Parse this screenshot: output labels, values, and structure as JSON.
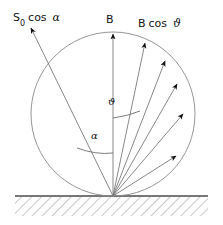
{
  "figure": {
    "labels": {
      "incident_flux": {
        "symbol": "S",
        "subscript": "0",
        "expression": "cos",
        "angle": "α",
        "full": "S0 cos α"
      },
      "vertical_vector": {
        "text": "B"
      },
      "cosine_vector": {
        "symbol": "B",
        "expression": "cos",
        "angle": "ϑ",
        "full": "B cos ϑ"
      },
      "angle_theta": {
        "text": "ϑ"
      },
      "angle_alpha": {
        "text": "α"
      }
    },
    "colors": {
      "stroke": "#8a8a8a",
      "stroke_dark": "#6e6e6e",
      "text": "#141414",
      "ground_line": "#4a4a4a",
      "hatch": "#9a9a9a",
      "background": "#ffffff"
    },
    "geometry": {
      "origin": {
        "x": 113,
        "y": 196
      },
      "circle": {
        "cx": 113,
        "cy": 114,
        "r": 82
      },
      "ground": {
        "x1": 15,
        "x2": 208,
        "y": 196,
        "band_height": 20
      },
      "incident_ray": {
        "tip_x": 30,
        "tip_y": 27
      },
      "vertical_ray": {
        "tip_x": 113,
        "tip_y": 33
      },
      "emitted_rays": [
        {
          "name": "ray-1",
          "tip_x": 146,
          "tip_y": 42
        },
        {
          "name": "ray-2",
          "tip_x": 166,
          "tip_y": 60
        },
        {
          "name": "ray-3",
          "tip_x": 178,
          "tip_y": 83
        },
        {
          "name": "ray-4",
          "tip_x": 184,
          "tip_y": 113
        },
        {
          "name": "ray-5",
          "tip_x": 177,
          "tip_y": 155
        }
      ],
      "angle_arc_theta": {
        "y": 117,
        "x1": 113,
        "x2": 141
      },
      "angle_arc_alpha": {
        "y": 152,
        "x1": 78,
        "x2": 113
      }
    }
  }
}
